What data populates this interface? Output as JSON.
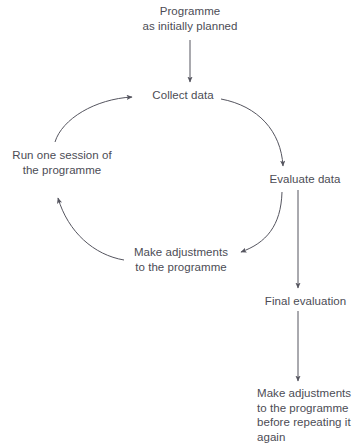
{
  "diagram": {
    "line_color": "#55555f",
    "text_color": "#4c4c55",
    "background": "#ffffff",
    "nodes": {
      "programme": "Programme\nas initially planned",
      "collect_data": "Collect data",
      "evaluate_data": "Evaluate data",
      "make_adjustments_cycle": "Make adjustments\nto the programme",
      "run_session": "Run one session of\nthe programme",
      "final_evaluation": "Final evaluation",
      "make_adjustments_final": "Make adjustments\nto the programme\nbefore repeating it\nagain"
    },
    "edges": [
      {
        "from": "programme",
        "to": "collect_data",
        "style": "straight-vertical"
      },
      {
        "from": "collect_data",
        "to": "evaluate_data",
        "style": "arc-clockwise"
      },
      {
        "from": "evaluate_data",
        "to": "make_adjustments_cycle",
        "style": "arc-clockwise"
      },
      {
        "from": "make_adjustments_cycle",
        "to": "run_session",
        "style": "arc-clockwise"
      },
      {
        "from": "run_session",
        "to": "collect_data",
        "style": "arc-clockwise"
      },
      {
        "from": "evaluate_data",
        "to": "final_evaluation",
        "style": "straight-vertical"
      },
      {
        "from": "final_evaluation",
        "to": "make_adjustments_final",
        "style": "straight-vertical"
      }
    ]
  }
}
